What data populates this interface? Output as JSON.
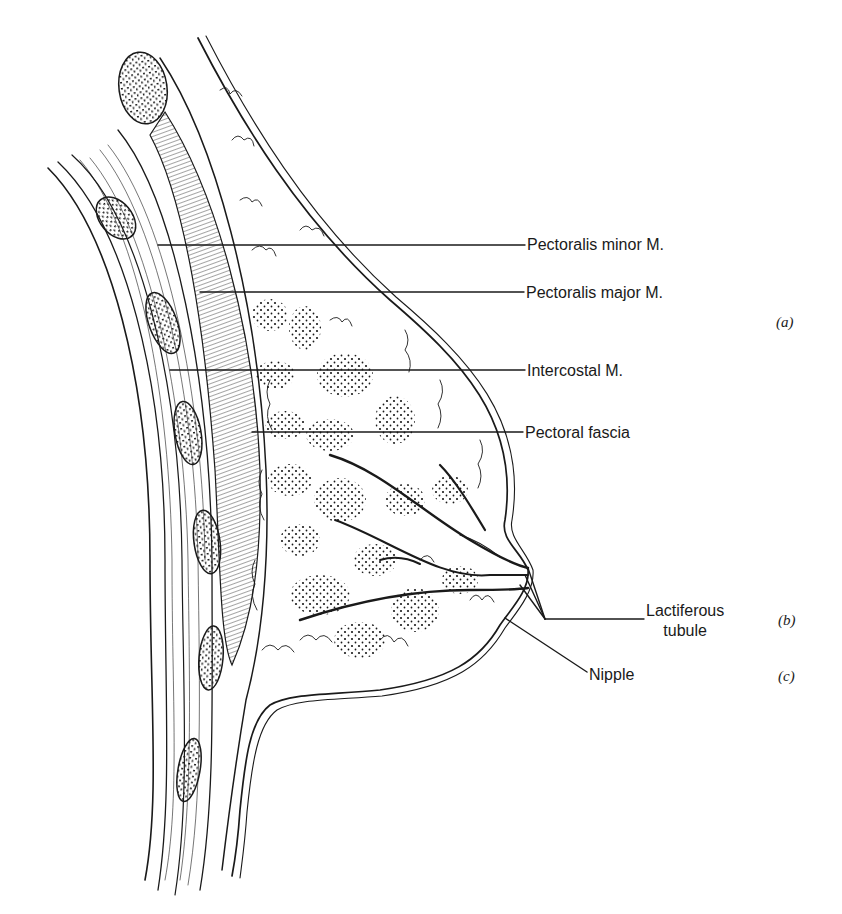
{
  "figure": {
    "labels": [
      {
        "id": "pectoralis-minor",
        "text": "Pectoralis minor M.",
        "x": 527,
        "y": 236
      },
      {
        "id": "pectoralis-major",
        "text": "Pectoralis major M.",
        "x": 526,
        "y": 284
      },
      {
        "id": "intercostal",
        "text": "Intercostal M.",
        "x": 527,
        "y": 363
      },
      {
        "id": "pectoral-fascia",
        "text": "Pectoral fascia",
        "x": 525,
        "y": 425
      },
      {
        "id": "lactiferous-tubule",
        "text": "Lactiferous\ntubule",
        "line1": "Lactiferous",
        "line2": "tubule",
        "x": 646,
        "y": 606
      },
      {
        "id": "nipple",
        "text": "Nipple",
        "x": 589,
        "y": 668
      }
    ],
    "tags": [
      {
        "id": "a",
        "text": "(a)",
        "x": 776,
        "y": 316
      },
      {
        "id": "b",
        "text": "(b)",
        "x": 778,
        "y": 614
      },
      {
        "id": "c",
        "text": "(c)",
        "x": 778,
        "y": 670
      }
    ],
    "colors": {
      "ink": "#1a1a1a",
      "background": "#ffffff"
    }
  }
}
